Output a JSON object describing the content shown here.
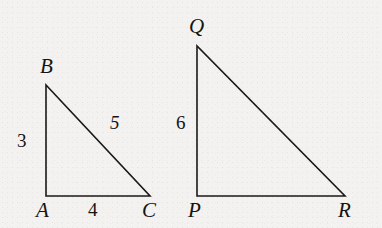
{
  "figure": {
    "kind": "geometry-diagram",
    "background_color": "#f3f2f0",
    "stroke_color": "#1a1816",
    "text_color": "#161412",
    "stroke_width": 1.6,
    "canvas": {
      "width": 382,
      "height": 228
    }
  },
  "shapes": [
    {
      "id": "triangle-abc",
      "name": "triangle-abc",
      "vertex_order": "A,B,C",
      "points": "46,196 46,85 150,196",
      "vertices": [
        {
          "key": "A",
          "label": "A",
          "x": 46,
          "y": 196,
          "label_x": 36,
          "label_y": 200
        },
        {
          "key": "B",
          "label": "B",
          "x": 46,
          "y": 85,
          "label_x": 40,
          "label_y": 56
        },
        {
          "key": "C",
          "label": "C",
          "x": 150,
          "y": 196,
          "label_x": 142,
          "label_y": 200
        }
      ],
      "sides": [
        {
          "key": "AB",
          "label": "3",
          "style": "upright",
          "label_x": 17,
          "label_y": 131
        },
        {
          "key": "AC",
          "label": "4",
          "style": "upright",
          "label_x": 88,
          "label_y": 200
        },
        {
          "key": "BC",
          "label": "5",
          "style": "slanted",
          "label_x": 110,
          "label_y": 113
        }
      ]
    },
    {
      "id": "triangle-pqr",
      "name": "triangle-pqr",
      "vertex_order": "P,Q,R",
      "points": "197,196 197,46 345,196",
      "vertices": [
        {
          "key": "P",
          "label": "P",
          "x": 197,
          "y": 196,
          "label_x": 188,
          "label_y": 200
        },
        {
          "key": "Q",
          "label": "Q",
          "x": 197,
          "y": 46,
          "label_x": 189,
          "label_y": 16
        },
        {
          "key": "R",
          "label": "R",
          "x": 345,
          "y": 196,
          "label_x": 338,
          "label_y": 200
        }
      ],
      "sides": [
        {
          "key": "PQ",
          "label": "6",
          "style": "upright",
          "label_x": 176,
          "label_y": 113
        }
      ]
    }
  ],
  "labels": {
    "triangle_abc": {
      "vertex_a": "A",
      "vertex_b": "B",
      "vertex_c": "C",
      "side_ab": "3",
      "side_ac": "4",
      "side_bc": "5"
    },
    "triangle_pqr": {
      "vertex_p": "P",
      "vertex_q": "Q",
      "vertex_r": "R",
      "side_pq": "6"
    }
  }
}
